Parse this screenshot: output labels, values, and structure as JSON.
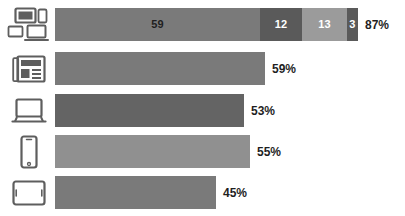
{
  "chart_data": {
    "type": "bar",
    "title": "",
    "subtitle": "",
    "xlabel": "",
    "ylabel": "",
    "orientation": "horizontal",
    "stacked_first_row": true,
    "grid": false,
    "legend": "none",
    "xlim": [
      0,
      100
    ],
    "categories": [
      "any-device",
      "newspaper",
      "laptop",
      "smartphone",
      "tablet"
    ],
    "values": [
      87,
      59,
      53,
      55,
      45
    ],
    "labels": [
      "87%",
      "59%",
      "53%",
      "55%",
      "45%"
    ],
    "series": [
      {
        "name": "Total",
        "values": [
          87,
          59,
          53,
          55,
          45
        ]
      }
    ],
    "stack_segments": [
      59,
      12,
      13,
      3
    ],
    "stack_segment_labels": [
      "59",
      "12",
      "13",
      "3"
    ],
    "stack_total": 87,
    "stack_total_label": "87%"
  },
  "colors": {
    "segment_1": "#7a7a7a",
    "segment_2": "#5a5a5a",
    "segment_3": "#9b9b9b",
    "segment_4": "#5a5a5a",
    "bar_medium": "#7a7a7a",
    "bar_dark": "#646464",
    "bar_light": "#909090",
    "icon_stroke": "#5e5e5e",
    "label_text": "#1f1f1f",
    "segment_text_light": "#ffffff",
    "segment_text_dark": "#1f1f1f",
    "background": "#ffffff"
  },
  "rows": [
    {
      "icon": "multi-device-icon",
      "value": 87,
      "label": "87%",
      "bar_width_px": 303,
      "segments": [
        {
          "label": "59",
          "width_px": 205,
          "color": "#7a7a7a",
          "text_color": "dark"
        },
        {
          "label": "12",
          "width_px": 42,
          "color": "#5a5a5a",
          "text_color": "light"
        },
        {
          "label": "13",
          "width_px": 45,
          "color": "#9b9b9b",
          "text_color": "light"
        },
        {
          "label": "3",
          "width_px": 11,
          "color": "#5a5a5a",
          "text_color": "light"
        }
      ]
    },
    {
      "icon": "newspaper-icon",
      "value": 59,
      "label": "59%",
      "bar_width_px": 210,
      "segments": [
        {
          "label": "",
          "width_px": 210,
          "color": "#7a7a7a",
          "text_color": "light"
        }
      ]
    },
    {
      "icon": "laptop-icon",
      "value": 53,
      "label": "53%",
      "bar_width_px": 189,
      "segments": [
        {
          "label": "",
          "width_px": 189,
          "color": "#646464",
          "text_color": "light"
        }
      ]
    },
    {
      "icon": "smartphone-icon",
      "value": 55,
      "label": "55%",
      "bar_width_px": 195,
      "segments": [
        {
          "label": "",
          "width_px": 195,
          "color": "#909090",
          "text_color": "light"
        }
      ]
    },
    {
      "icon": "tablet-icon",
      "value": 45,
      "label": "45%",
      "bar_width_px": 161,
      "segments": [
        {
          "label": "",
          "width_px": 161,
          "color": "#7a7a7a",
          "text_color": "light"
        }
      ]
    }
  ],
  "layout": {
    "row_tops": [
      8,
      52,
      94,
      135,
      176
    ],
    "row_height": 33,
    "bar_left": 55,
    "label_gap": 7
  }
}
